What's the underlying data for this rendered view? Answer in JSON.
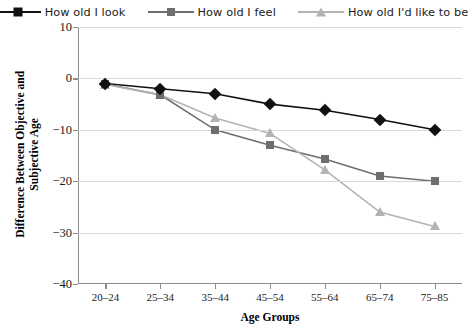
{
  "chart_data": {
    "type": "line",
    "title": "",
    "xlabel": "Age Groups",
    "ylabel": "Difference Between Objective and Subjective Age",
    "categories": [
      "20–24",
      "25–34",
      "35–44",
      "45–54",
      "55–64",
      "65–74",
      "75–85"
    ],
    "ylim": [
      -40,
      10
    ],
    "yticks": [
      10,
      0,
      -10,
      -20,
      -30,
      -40
    ],
    "ytick_labels": [
      "10",
      "0",
      "−10",
      "−20",
      "−30",
      "−40"
    ],
    "grid": true,
    "legend_position": "top",
    "series": [
      {
        "name": "How old I look",
        "marker": "diamond",
        "color": "#111111",
        "values": [
          -1.0,
          -2.0,
          -3.0,
          -5.0,
          -6.2,
          -8.0,
          -10.0
        ]
      },
      {
        "name": "How old I feel",
        "marker": "square",
        "color": "#6e6e6e",
        "values": [
          -1.1,
          -3.2,
          -10.0,
          -13.0,
          -15.7,
          -19.0,
          -20.0
        ]
      },
      {
        "name": "How old I'd like to be",
        "marker": "triangle",
        "color": "#b3b3b3",
        "values": [
          -1.2,
          -3.2,
          -7.7,
          -10.7,
          -17.8,
          -26.0,
          -28.8
        ]
      }
    ]
  },
  "legend": {
    "items": [
      {
        "label": "How old I look"
      },
      {
        "label": "How old I feel"
      },
      {
        "label": "How old I'd like to be"
      }
    ]
  },
  "axes": {
    "x_title": "Age Groups",
    "y_title": "Difference Between Objective and Subjective Age"
  }
}
